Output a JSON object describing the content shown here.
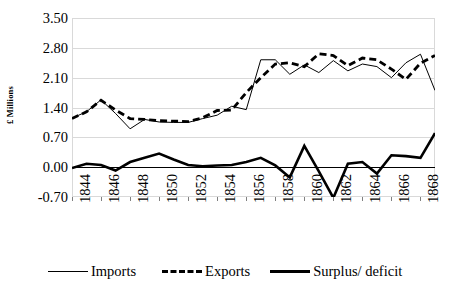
{
  "chart_data": {
    "type": "line",
    "title": "",
    "xlabel": "",
    "ylabel": "£ Millions",
    "ylim": [
      -0.7,
      3.5
    ],
    "xlim": [
      1844,
      1869
    ],
    "yticks": [
      "3.50",
      "2.80",
      "2.10",
      "1.40",
      "0.70",
      "0.00",
      "-0.70"
    ],
    "ytick_values": [
      3.5,
      2.8,
      2.1,
      1.4,
      0.7,
      0.0,
      -0.7
    ],
    "xticks": [
      "1844",
      "1846",
      "1848",
      "1850",
      "1852",
      "1854",
      "1856",
      "1858",
      "1860",
      "1862",
      "1864",
      "1866",
      "1868"
    ],
    "xtick_values": [
      1844,
      1846,
      1848,
      1850,
      1852,
      1854,
      1856,
      1858,
      1860,
      1862,
      1864,
      1866,
      1868
    ],
    "grid": "horizontal",
    "legend_position": "bottom",
    "x": [
      1844,
      1845,
      1846,
      1847,
      1848,
      1849,
      1850,
      1851,
      1852,
      1853,
      1854,
      1855,
      1856,
      1857,
      1858,
      1859,
      1860,
      1861,
      1862,
      1863,
      1864,
      1865,
      1866,
      1867,
      1868,
      1869
    ],
    "series": [
      {
        "name": "Imports",
        "style": "thin-solid",
        "color": "#000000",
        "values": [
          1.15,
          1.3,
          1.58,
          1.26,
          0.9,
          1.12,
          1.06,
          1.05,
          1.05,
          1.14,
          1.22,
          1.43,
          1.35,
          2.52,
          2.52,
          2.18,
          2.4,
          2.22,
          2.5,
          2.26,
          2.42,
          2.36,
          2.1,
          2.45,
          2.65,
          1.8
        ]
      },
      {
        "name": "Exports",
        "style": "thick-dashed",
        "color": "#000000",
        "values": [
          1.14,
          1.3,
          1.57,
          1.34,
          1.14,
          1.12,
          1.09,
          1.08,
          1.07,
          1.16,
          1.33,
          1.34,
          1.75,
          2.1,
          2.42,
          2.45,
          2.36,
          2.66,
          2.62,
          2.38,
          2.56,
          2.52,
          2.3,
          2.06,
          2.44,
          2.62
        ]
      },
      {
        "name": "Surplus/ deficit",
        "style": "thick-solid",
        "color": "#000000",
        "values": [
          -0.02,
          0.08,
          0.05,
          -0.08,
          0.12,
          0.22,
          0.32,
          0.18,
          0.05,
          0.02,
          0.04,
          0.05,
          0.12,
          0.22,
          0.04,
          -0.24,
          0.5,
          -0.1,
          -0.72,
          0.08,
          0.12,
          -0.15,
          0.28,
          0.26,
          0.22,
          0.8
        ]
      }
    ]
  },
  "legend": {
    "items": [
      {
        "label": "Imports"
      },
      {
        "label": "Exports"
      },
      {
        "label": "Surplus/ deficit"
      }
    ]
  }
}
